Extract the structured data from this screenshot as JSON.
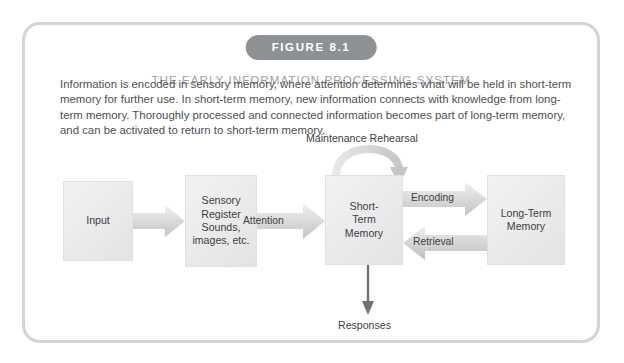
{
  "figure": {
    "badge_label": "FIGURE 8.1",
    "title": "THE EARLY INFORMATION PROCESSING SYSTEM",
    "caption": "Information is encoded in sensory memory, where attention determines what will be held in short-term memory for further use. In short-term memory, new information connects with knowledge from long-term memory. Thoroughly processed and connected information becomes part of long-term memory, and can be activated to return to short-term memory."
  },
  "diagram": {
    "boxes": [
      {
        "id": "input",
        "label": "Input"
      },
      {
        "id": "sensory-register",
        "label": "Sensory\nRegister\nSounds,\nimages, etc."
      },
      {
        "id": "short-term-memory",
        "label": "Short-\nTerm\nMemory"
      },
      {
        "id": "long-term-memory",
        "label": "Long-Term\nMemory"
      }
    ],
    "arrow_labels": [
      {
        "id": "attention",
        "label": "Attention"
      },
      {
        "id": "encoding",
        "label": "Encoding"
      },
      {
        "id": "retrieval",
        "label": "Retrieval"
      }
    ],
    "annotations": [
      {
        "id": "maintenance-rehearsal",
        "label": "Maintenance Rehearsal"
      },
      {
        "id": "responses",
        "label": "Responses"
      }
    ]
  },
  "colors": {
    "frame_border": "#d2d4d6",
    "badge_background": "#8e9194",
    "badge_text": "#ffffff",
    "title_text": "#9b9ea2",
    "body_text": "#4b4f55",
    "box_fill": "#eaeaea",
    "arrow_fill": "#cfcfcf",
    "response_arrow": "#6f7378"
  }
}
